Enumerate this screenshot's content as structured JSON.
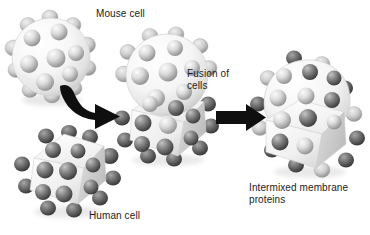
{
  "figure": {
    "background_color": "#ffffff",
    "width": 370,
    "height": 235
  },
  "labels": {
    "mouse_cell": "Mouse cell",
    "fusion_of_cells": "Fusion of\ncells",
    "human_cell": "Human cell",
    "intermixed": "Intermixed membrane\nproteins"
  },
  "colors": {
    "text": "#1c1c1c",
    "arrow": "#111111",
    "light_protein": "#d4d4d4",
    "light_protein_dark": "#9a9a9a",
    "dark_protein": "#6f6f6f",
    "dark_protein_dark": "#3a3a3a",
    "membrane_light": "#f2f2f2",
    "membrane_shadow": "#c9c9c9"
  },
  "cells": {
    "mouse": {
      "name": "Mouse cell",
      "shape": "sphere",
      "protein_type": "light",
      "protein_count": 13
    },
    "human": {
      "name": "Human cell",
      "shape": "angular",
      "protein_type": "dark",
      "protein_count": 16
    },
    "fused": {
      "name": "Fusion of cells",
      "shape": "sphere-plus-angular",
      "protein_type": "segregated",
      "protein_count": 22
    },
    "intermixed": {
      "name": "Intermixed membrane proteins",
      "shape": "angular",
      "protein_type": "mixed",
      "protein_count": 23
    }
  },
  "arrows": {
    "first": {
      "style": "curved",
      "direction": "right"
    },
    "second": {
      "style": "straight",
      "direction": "right"
    }
  }
}
